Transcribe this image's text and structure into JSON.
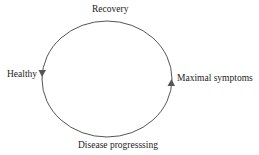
{
  "diagram": {
    "type": "cycle",
    "colors": {
      "stroke": "#555555",
      "text": "#222222",
      "background": "#ffffff"
    },
    "nodes": [
      {
        "id": "recovery",
        "label": "Recovery",
        "position": "top"
      },
      {
        "id": "healthy",
        "label": "Healthy",
        "position": "left"
      },
      {
        "id": "maximal",
        "label": "Maximal symptoms",
        "position": "right"
      },
      {
        "id": "progressing",
        "label": "Disease progresssing",
        "position": "bottom"
      }
    ],
    "arrows": [
      {
        "at": "left",
        "direction": "down",
        "icon": "arrowhead-down-icon"
      },
      {
        "at": "right",
        "direction": "up",
        "icon": "arrowhead-up-icon"
      }
    ]
  }
}
